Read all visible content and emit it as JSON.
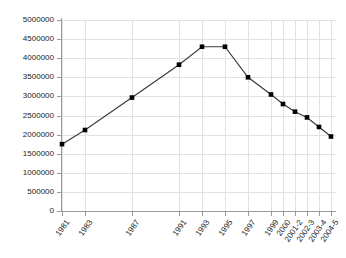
{
  "chart_data": {
    "type": "line",
    "title": "",
    "subtitle": "",
    "xlabel": "",
    "ylabel": "",
    "grid": true,
    "legend": false,
    "ylim": [
      0,
      5000000
    ],
    "ytick_step": 500000,
    "ytick_labels": [
      "5000000",
      "4500000",
      "4000000",
      "3500000",
      "3000000",
      "2500000",
      "2000000",
      "1500000",
      "1000000",
      "500000",
      "0"
    ],
    "ytick_values": [
      5000000,
      4500000,
      4000000,
      3500000,
      3000000,
      2500000,
      2000000,
      1500000,
      1000000,
      500000,
      0
    ],
    "categories": [
      "1981",
      "1983",
      "1987",
      "1991",
      "1993",
      "1995",
      "1997",
      "1999",
      "2000",
      "2001-2",
      "2002-3",
      "2003-4",
      "2004-5"
    ],
    "values": [
      1750000,
      2120000,
      2970000,
      3830000,
      4300000,
      4300000,
      3500000,
      3050000,
      2800000,
      2600000,
      2450000,
      2200000,
      1950000
    ],
    "series": [
      {
        "name": "series-1",
        "values": [
          1750000,
          2120000,
          2970000,
          3830000,
          4300000,
          4300000,
          3500000,
          3050000,
          2800000,
          2600000,
          2450000,
          2200000,
          1950000
        ],
        "line_color": "#3c3c3c",
        "marker_color": "#000000",
        "marker": "square"
      }
    ],
    "category_positions": [
      0,
      23,
      70,
      117,
      140,
      163,
      186,
      209,
      221,
      233,
      245,
      257,
      269
    ],
    "colors": {
      "line": "#3c3c3c",
      "marker": "#000000",
      "grid": "#e2e2e2",
      "axis": "#9a9a9a",
      "background": "#ffffff",
      "text": "#1a1a1a"
    }
  }
}
